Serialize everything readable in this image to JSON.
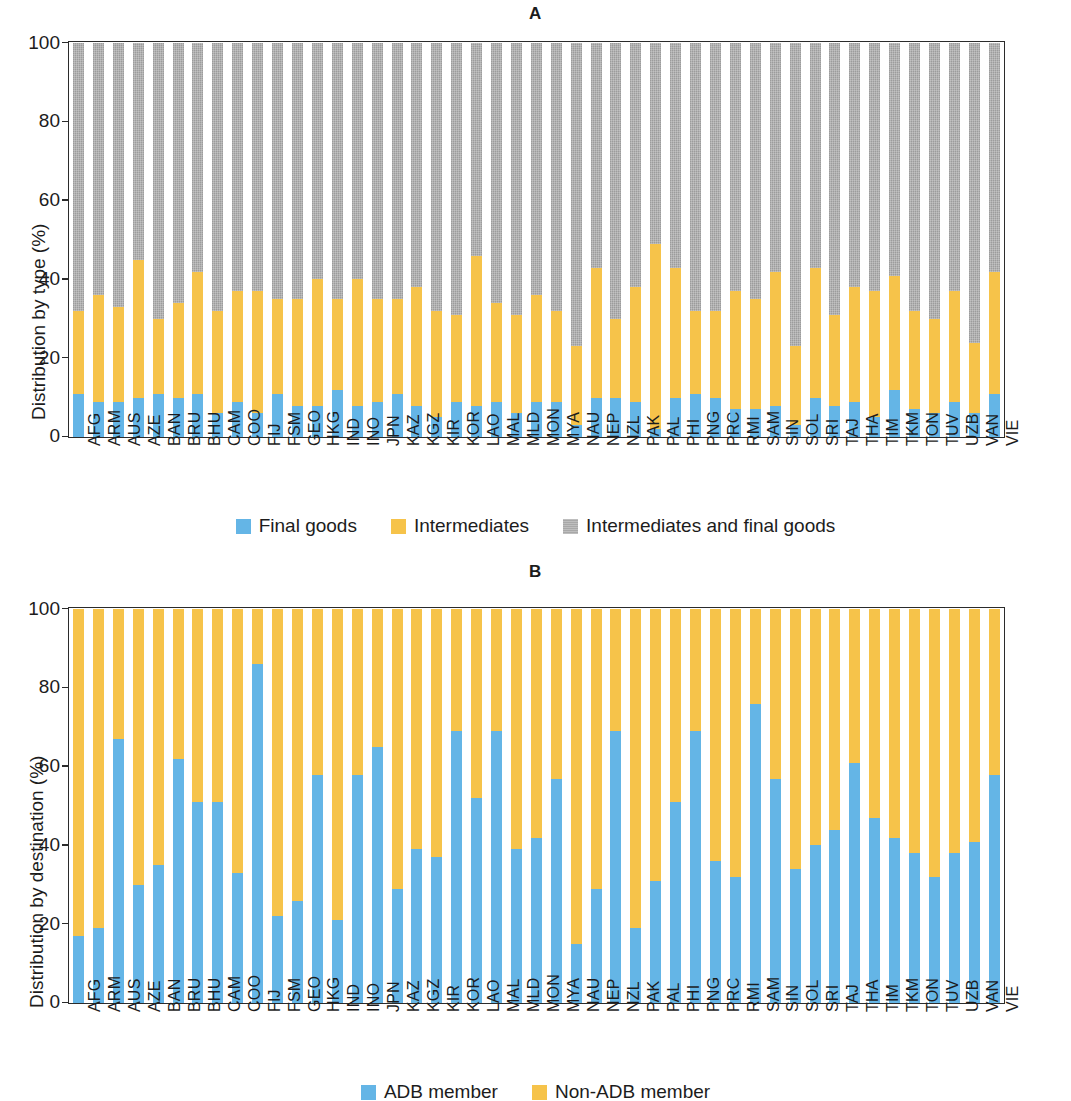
{
  "figure": {
    "background_color": "#ffffff"
  },
  "panels": [
    {
      "id": "A",
      "title": "A",
      "ylabel": "Distribution by type (%)",
      "yticks": [
        "0",
        "20",
        "40",
        "60",
        "80",
        "100"
      ],
      "legend": [
        {
          "label": "Final goods",
          "color": "#64b5e6",
          "key": "final_goods"
        },
        {
          "label": "Intermediates",
          "color": "#f6c34a",
          "key": "intermediates"
        },
        {
          "label": "Intermediates and final goods",
          "color": "#a8a8a8",
          "key": "intermediates_and_final_goods"
        }
      ]
    },
    {
      "id": "B",
      "title": "B",
      "ylabel": "Distribution by destination (%)",
      "yticks": [
        "0",
        "20",
        "40",
        "60",
        "80",
        "100"
      ],
      "legend": [
        {
          "label": "ADB member",
          "color": "#64b5e6",
          "key": "adb_member"
        },
        {
          "label": "Non-ADB member",
          "color": "#f6c34a",
          "key": "non_adb_member"
        }
      ]
    }
  ],
  "chart_data": [
    {
      "type": "bar",
      "stacked": true,
      "normalized_percent": true,
      "panel": "A",
      "title": "A",
      "xlabel": "",
      "ylabel": "Distribution by type (%)",
      "ylim": [
        0,
        100
      ],
      "yticks": [
        0,
        20,
        40,
        60,
        80,
        100
      ],
      "grid": false,
      "legend_position": "bottom",
      "categories": [
        "AFG",
        "ARM",
        "AUS",
        "AZE",
        "BAN",
        "BRU",
        "BHU",
        "CAM",
        "COO",
        "FIJ",
        "FSM",
        "GEO",
        "HKG",
        "IND",
        "INO",
        "JPN",
        "KAZ",
        "KGZ",
        "KIR",
        "KOR",
        "LAO",
        "MAL",
        "MLD",
        "MON",
        "MYA",
        "NAU",
        "NEP",
        "NZL",
        "PAK",
        "PAL",
        "PHI",
        "PNG",
        "PRC",
        "RMI",
        "SAM",
        "SIN",
        "SOL",
        "SRI",
        "TAJ",
        "THA",
        "TIM",
        "TKM",
        "TON",
        "TUV",
        "UZB",
        "VAN",
        "VIE"
      ],
      "series": [
        {
          "name": "Final goods",
          "color": "#64b5e6",
          "values": [
            11,
            9,
            9,
            10,
            11,
            10,
            11,
            6,
            9,
            6,
            11,
            8,
            8,
            12,
            8,
            9,
            11,
            8,
            5,
            9,
            8,
            9,
            6,
            9,
            9,
            3,
            10,
            10,
            9,
            2,
            10,
            11,
            10,
            7,
            7,
            8,
            3,
            10,
            8,
            9,
            5,
            12,
            7,
            6,
            9,
            6,
            11
          ]
        },
        {
          "name": "Intermediates",
          "color": "#f6c34a",
          "values": [
            21,
            27,
            24,
            35,
            19,
            24,
            31,
            26,
            28,
            31,
            24,
            27,
            32,
            23,
            32,
            26,
            24,
            30,
            27,
            22,
            38,
            25,
            25,
            27,
            23,
            20,
            33,
            20,
            29,
            47,
            33,
            21,
            22,
            30,
            28,
            34,
            20,
            33,
            23,
            29,
            32,
            29,
            25,
            24,
            28,
            18,
            31
          ]
        },
        {
          "name": "Intermediates and final goods",
          "color": "#a8a8a8",
          "values": [
            68,
            64,
            67,
            55,
            70,
            66,
            58,
            68,
            63,
            63,
            65,
            65,
            60,
            65,
            60,
            65,
            65,
            62,
            68,
            69,
            54,
            66,
            69,
            64,
            68,
            77,
            57,
            70,
            62,
            51,
            57,
            68,
            68,
            63,
            65,
            58,
            77,
            57,
            69,
            62,
            63,
            59,
            68,
            70,
            63,
            76,
            58
          ]
        }
      ]
    },
    {
      "type": "bar",
      "stacked": true,
      "normalized_percent": true,
      "panel": "B",
      "title": "B",
      "xlabel": "",
      "ylabel": "Distribution by destination (%)",
      "ylim": [
        0,
        100
      ],
      "yticks": [
        0,
        20,
        40,
        60,
        80,
        100
      ],
      "grid": false,
      "legend_position": "bottom",
      "categories": [
        "AFG",
        "ARM",
        "AUS",
        "AZE",
        "BAN",
        "BRU",
        "BHU",
        "CAM",
        "COO",
        "FIJ",
        "FSM",
        "GEO",
        "HKG",
        "IND",
        "INO",
        "JPN",
        "KAZ",
        "KGZ",
        "KIR",
        "KOR",
        "LAO",
        "MAL",
        "MLD",
        "MON",
        "MYA",
        "NAU",
        "NEP",
        "NZL",
        "PAK",
        "PAL",
        "PHI",
        "PNG",
        "PRC",
        "RMI",
        "SAM",
        "SIN",
        "SOL",
        "SRI",
        "TAJ",
        "THA",
        "TIM",
        "TKM",
        "TON",
        "TUV",
        "UZB",
        "VAN",
        "VIE"
      ],
      "series": [
        {
          "name": "ADB member",
          "color": "#64b5e6",
          "values": [
            17,
            19,
            67,
            30,
            35,
            62,
            51,
            51,
            33,
            86,
            22,
            26,
            58,
            21,
            58,
            65,
            29,
            39,
            37,
            69,
            52,
            69,
            39,
            42,
            57,
            15,
            29,
            69,
            19,
            31,
            51,
            69,
            36,
            32,
            76,
            57,
            34,
            40,
            44,
            61,
            47,
            42,
            38,
            32,
            38,
            41,
            58
          ]
        },
        {
          "name": "Non-ADB member",
          "color": "#f6c34a",
          "values": [
            83,
            81,
            33,
            70,
            65,
            38,
            49,
            49,
            67,
            14,
            78,
            74,
            42,
            79,
            42,
            35,
            71,
            61,
            63,
            31,
            48,
            31,
            61,
            58,
            43,
            85,
            71,
            31,
            81,
            69,
            49,
            31,
            64,
            68,
            24,
            43,
            66,
            60,
            56,
            39,
            53,
            58,
            62,
            68,
            62,
            59,
            42
          ]
        }
      ]
    }
  ]
}
